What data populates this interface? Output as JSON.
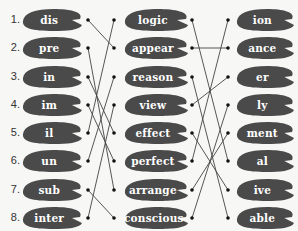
{
  "exercise": {
    "type": "word-building matching",
    "numbers": [
      "1.",
      "2.",
      "3.",
      "4.",
      "5.",
      "6.",
      "7.",
      "8."
    ],
    "prefixes": [
      "dis",
      "pre",
      "in",
      "im",
      "il",
      "un",
      "sub",
      "inter"
    ],
    "roots": [
      "logic",
      "appear",
      "reason",
      "view",
      "effect",
      "perfect",
      "arrange",
      "conscious"
    ],
    "suffixes": [
      "ion",
      "ance",
      "er",
      "ly",
      "ment",
      "al",
      "ive",
      "able"
    ],
    "pad_color": "#4a4a4a",
    "line_color": "#444444",
    "prefix_to_root": [
      {
        "from": "dis",
        "to": "appear"
      },
      {
        "from": "pre",
        "to": "arrange"
      },
      {
        "from": "in",
        "to": "effect"
      },
      {
        "from": "im",
        "to": "perfect"
      },
      {
        "from": "il",
        "to": "logic"
      },
      {
        "from": "un",
        "to": "reason"
      },
      {
        "from": "sub",
        "to": "conscious"
      },
      {
        "from": "inter",
        "to": "view"
      }
    ],
    "root_to_suffix": [
      {
        "from": "logic",
        "to": "al"
      },
      {
        "from": "appear",
        "to": "ance"
      },
      {
        "from": "reason",
        "to": "able"
      },
      {
        "from": "view",
        "to": "er"
      },
      {
        "from": "effect",
        "to": "ive"
      },
      {
        "from": "perfect",
        "to": "ion"
      },
      {
        "from": "arrange",
        "to": "ment"
      },
      {
        "from": "conscious",
        "to": "ly"
      }
    ]
  }
}
